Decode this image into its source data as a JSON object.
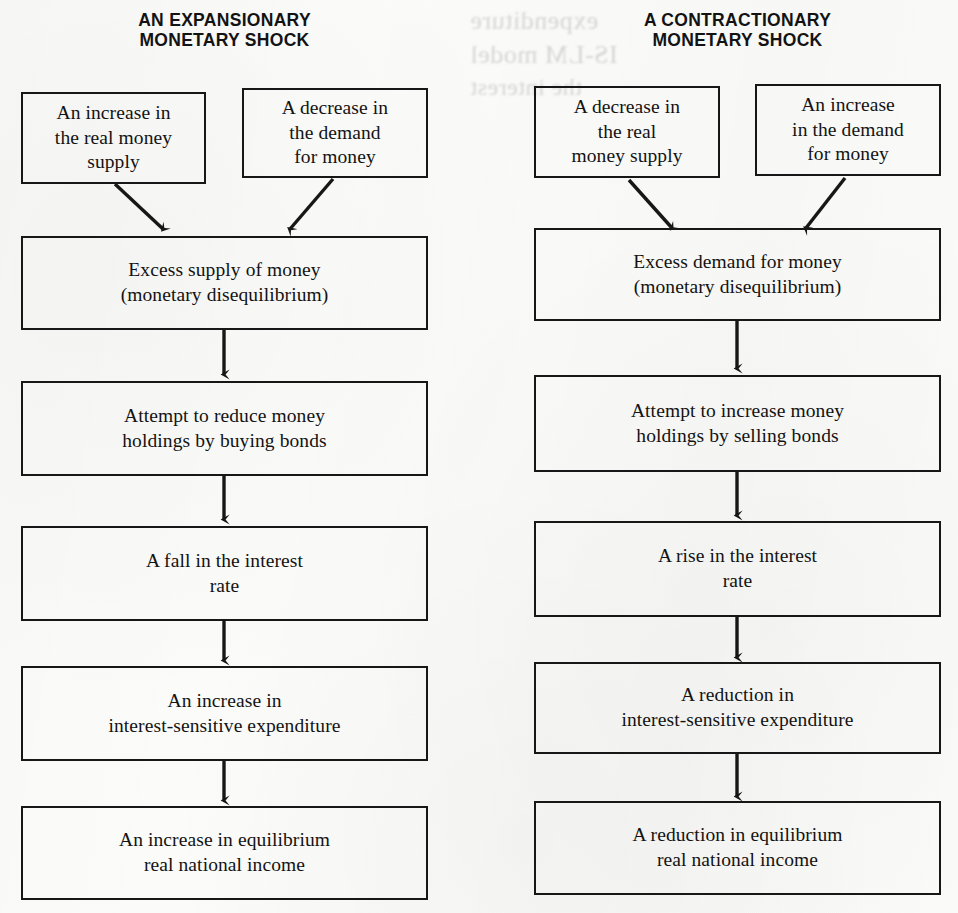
{
  "page": {
    "width": 958,
    "height": 913,
    "background_color": "#fbfbf9",
    "ink_color": "#171717"
  },
  "columns": [
    {
      "id": "expansionary",
      "title_line1": "AN EXPANSIONARY",
      "title_line2": "MONETARY SHOCK",
      "nodes": [
        {
          "id": "src-a",
          "line1": "An increase in",
          "line2": "the real money",
          "line3": "supply"
        },
        {
          "id": "src-b",
          "line1": "A decrease in",
          "line2": "the demand",
          "line3": "for money"
        },
        {
          "id": "step-1",
          "line1": "Excess supply of money",
          "line2": "(monetary disequilibrium)"
        },
        {
          "id": "step-2",
          "line1": "Attempt to reduce money",
          "line2": "holdings by buying bonds"
        },
        {
          "id": "step-3",
          "line1": "A fall in the interest",
          "line2": "rate"
        },
        {
          "id": "step-4",
          "line1": "An increase in",
          "line2": "interest-sensitive expenditure"
        },
        {
          "id": "step-5",
          "line1": "An increase in equilibrium",
          "line2": "real national income"
        }
      ]
    },
    {
      "id": "contractionary",
      "title_line1": "A CONTRACTIONARY",
      "title_line2": "MONETARY SHOCK",
      "nodes": [
        {
          "id": "src-a",
          "line1": "A decrease in",
          "line2": "the real",
          "line3": "money supply"
        },
        {
          "id": "src-b",
          "line1": "An increase",
          "line2": "in the demand",
          "line3": "for money"
        },
        {
          "id": "step-1",
          "line1": "Excess demand for money",
          "line2": "(monetary disequilibrium)"
        },
        {
          "id": "step-2",
          "line1": "Attempt to increase money",
          "line2": "holdings by selling bonds"
        },
        {
          "id": "step-3",
          "line1": "A rise in the interest",
          "line2": "rate"
        },
        {
          "id": "step-4",
          "line1": "A reduction in",
          "line2": "interest-sensitive expenditure"
        },
        {
          "id": "step-5",
          "line1": "A reduction in equilibrium",
          "line2": "real national income"
        }
      ]
    }
  ],
  "bleed_through": {
    "t1": "expenditure",
    "t2": "IS-LM model",
    "t3": "the interest"
  }
}
